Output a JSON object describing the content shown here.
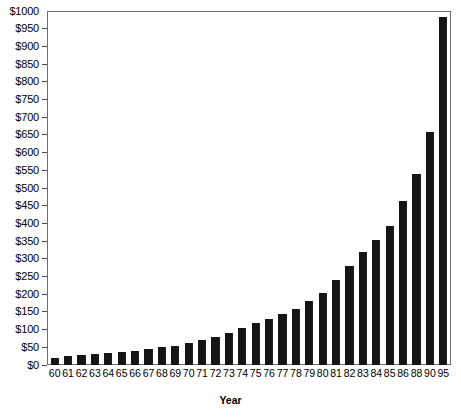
{
  "chart_data": {
    "type": "bar",
    "title": "",
    "xlabel": "Year",
    "ylabel": "",
    "ylim": [
      0,
      1000
    ],
    "ytick_step": 50,
    "ytick_prefix": "$",
    "grid": false,
    "legend": null,
    "bar_color": "#151515",
    "axis_color": "#6f6f6f",
    "yticks": [
      "$0",
      "$50",
      "$100",
      "$150",
      "$200",
      "$250",
      "$300",
      "$350",
      "$400",
      "$450",
      "$500",
      "$550",
      "$600",
      "$650",
      "$700",
      "$750",
      "$800",
      "$850",
      "$900",
      "$950",
      "$1000"
    ],
    "ytick_values": [
      0,
      50,
      100,
      150,
      200,
      250,
      300,
      350,
      400,
      450,
      500,
      550,
      600,
      650,
      700,
      750,
      800,
      850,
      900,
      950,
      1000
    ],
    "categories": [
      "60",
      "61",
      "62",
      "63",
      "64",
      "65",
      "66",
      "67",
      "68",
      "69",
      "70",
      "71",
      "72",
      "73",
      "74",
      "75",
      "76",
      "77",
      "78",
      "79",
      "80",
      "81",
      "82",
      "83",
      "84",
      "85",
      "86",
      "88",
      "90",
      "95"
    ],
    "values": [
      20,
      25,
      28,
      32,
      33,
      36,
      40,
      44,
      50,
      55,
      62,
      70,
      80,
      92,
      105,
      118,
      130,
      145,
      160,
      180,
      205,
      240,
      280,
      320,
      355,
      395,
      465,
      540,
      660,
      985
    ]
  }
}
